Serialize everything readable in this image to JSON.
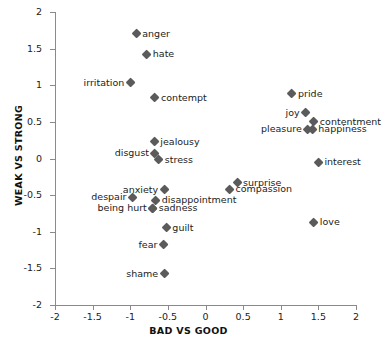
{
  "chart_data": {
    "type": "scatter",
    "title": "",
    "xlabel": "BAD VS GOOD",
    "ylabel": "WEAK VS STRONG",
    "xlim": [
      -2,
      2
    ],
    "ylim": [
      -2,
      2
    ],
    "grid": false,
    "legend": "none",
    "marker_color": "#5b5b5b",
    "marker_shape": "diamond",
    "xticks": [
      "-2",
      "-1.5",
      "-1",
      "-0.5",
      "0",
      "0.5",
      "1",
      "1.5",
      "2"
    ],
    "xtick_values": [
      -2,
      -1.5,
      -1,
      -0.5,
      0,
      0.5,
      1,
      1.5,
      2
    ],
    "yticks": [
      "2",
      "1.5",
      "1",
      "0.5",
      "0",
      "-0.5",
      "-1",
      "-1.5",
      "-2"
    ],
    "ytick_values": [
      2,
      1.5,
      1,
      0.5,
      0,
      -0.5,
      -1,
      -1.5,
      -2
    ],
    "points": [
      {
        "label": "anger",
        "x": -0.92,
        "y": 1.7,
        "side": "right"
      },
      {
        "label": "hate",
        "x": -0.78,
        "y": 1.42,
        "side": "right"
      },
      {
        "label": "irritation",
        "x": -1.0,
        "y": 1.03,
        "side": "left"
      },
      {
        "label": "contempt",
        "x": -0.67,
        "y": 0.83,
        "side": "right"
      },
      {
        "label": "pride",
        "x": 1.15,
        "y": 0.88,
        "side": "right"
      },
      {
        "label": "joy",
        "x": 1.33,
        "y": 0.62,
        "side": "left"
      },
      {
        "label": "contentment",
        "x": 1.44,
        "y": 0.5,
        "side": "right"
      },
      {
        "label": "pleasure",
        "x": 1.36,
        "y": 0.4,
        "side": "left"
      },
      {
        "label": "happiness",
        "x": 1.42,
        "y": 0.4,
        "side": "right"
      },
      {
        "label": "jealousy",
        "x": -0.68,
        "y": 0.23,
        "side": "right"
      },
      {
        "label": "disgust",
        "x": -0.67,
        "y": 0.07,
        "side": "left"
      },
      {
        "label": "stress",
        "x": -0.62,
        "y": -0.02,
        "side": "right"
      },
      {
        "label": "interest",
        "x": 1.5,
        "y": -0.05,
        "side": "right"
      },
      {
        "label": "surprise",
        "x": 0.42,
        "y": -0.33,
        "side": "right"
      },
      {
        "label": "compassion",
        "x": 0.32,
        "y": -0.42,
        "side": "right"
      },
      {
        "label": "anxiety",
        "x": -0.55,
        "y": -0.43,
        "side": "left"
      },
      {
        "label": "despair",
        "x": -0.97,
        "y": -0.53,
        "side": "left"
      },
      {
        "label": "disappointment",
        "x": -0.66,
        "y": -0.57,
        "side": "right"
      },
      {
        "label": "sadness",
        "x": -0.7,
        "y": -0.68,
        "side": "right"
      },
      {
        "label": "being hurt",
        "x": -0.7,
        "y": -0.68,
        "side": "left"
      },
      {
        "label": "guilt",
        "x": -0.52,
        "y": -0.95,
        "side": "right"
      },
      {
        "label": "love",
        "x": 1.44,
        "y": -0.87,
        "side": "right"
      },
      {
        "label": "fear",
        "x": -0.56,
        "y": -1.18,
        "side": "left"
      },
      {
        "label": "shame",
        "x": -0.55,
        "y": -1.57,
        "side": "left"
      }
    ]
  }
}
